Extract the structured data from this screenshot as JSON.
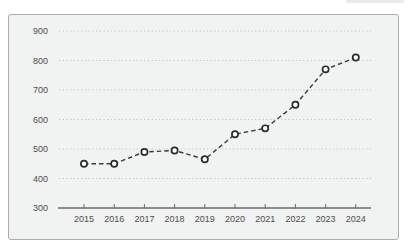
{
  "colors": {
    "page_background": "#ffffff",
    "card_background": "#f1f2f2",
    "card_border": "#adadad",
    "gridline": "#c5c5c5",
    "axis": "#6b6b6b",
    "tick_label": "#4d4d4d",
    "series_line": "#3a3a3a",
    "marker_fill": "#ffffff",
    "marker_stroke": "#2b2b2b"
  },
  "chart_data": {
    "type": "line",
    "title": "",
    "xlabel": "",
    "ylabel": "",
    "categories": [
      "2015",
      "2016",
      "2017",
      "2018",
      "2019",
      "2020",
      "2021",
      "2022",
      "2023",
      "2024"
    ],
    "series": [
      {
        "name": "series-1",
        "values": [
          450,
          450,
          490,
          495,
          465,
          550,
          570,
          650,
          770,
          810
        ]
      }
    ],
    "ylim": [
      300,
      900
    ],
    "yticks": [
      300,
      400,
      500,
      600,
      700,
      800,
      900
    ],
    "grid": "horizontal-dotted",
    "legend_position": "none",
    "line_style": "dashed",
    "marker_style": "open-circle"
  }
}
